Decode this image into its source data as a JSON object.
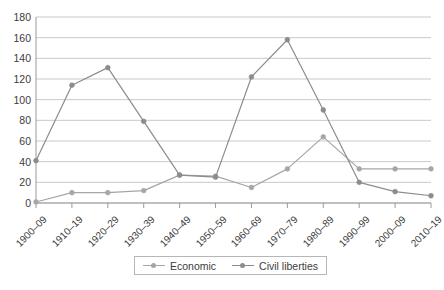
{
  "chart_data": {
    "type": "line",
    "title": "",
    "subtitle": "",
    "xlabel": "",
    "ylabel": "",
    "ylim": [
      0,
      180
    ],
    "ytick_step": 20,
    "yticks": [
      0,
      20,
      40,
      60,
      80,
      100,
      120,
      140,
      160,
      180
    ],
    "ytick_labels": [
      "0",
      "20",
      "40",
      "60",
      "80",
      "100",
      "120",
      "140",
      "160",
      "180"
    ],
    "grid": true,
    "grid_axis": "y",
    "legend_position": "bottom",
    "categories": [
      "1900–09",
      "1910–19",
      "1920–29",
      "1930–39",
      "1940–49",
      "1950–59",
      "1960–69",
      "1970–79",
      "1980–89",
      "1990–99",
      "2000–09",
      "2010–19"
    ],
    "series": [
      {
        "name": "Economic",
        "color": "#a6a6a6",
        "marker": "circle",
        "values": [
          1,
          10,
          10,
          12,
          27,
          26,
          15,
          33,
          64,
          33,
          33,
          33
        ]
      },
      {
        "name": "Civil liberties",
        "color": "#8c8c8c",
        "marker": "circle",
        "values": [
          41,
          114,
          131,
          79,
          27,
          25,
          122,
          158,
          90,
          20,
          11,
          7
        ]
      }
    ]
  },
  "legend": {
    "items": [
      {
        "label": "Economic"
      },
      {
        "label": "Civil liberties"
      }
    ]
  },
  "colors": {
    "grid": "#c9c9c9",
    "axis": "#9a9a9a",
    "text": "#3c3c3c",
    "background": "#ffffff",
    "series_economic": "#a6a6a6",
    "series_civil": "#8c8c8c"
  }
}
